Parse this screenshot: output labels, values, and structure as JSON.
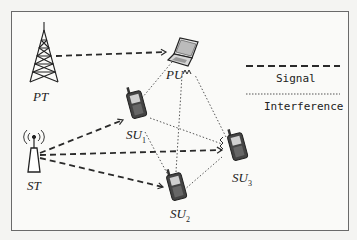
{
  "diagram": {
    "nodes": {
      "pt": {
        "label": "PT",
        "name": "Primary Transmitter",
        "icon": "cell-tower"
      },
      "pu": {
        "label": "PU",
        "name": "Primary User",
        "icon": "laptop"
      },
      "st": {
        "label": "ST",
        "name": "Secondary Transmitter",
        "icon": "antenna"
      },
      "su1": {
        "label": "SU",
        "sub": "1",
        "icon": "mobile-phone"
      },
      "su2": {
        "label": "SU",
        "sub": "2",
        "icon": "mobile-phone"
      },
      "su3": {
        "label": "SU",
        "sub": "3",
        "icon": "mobile-phone"
      }
    },
    "edges": [
      {
        "from": "PT",
        "to": "PU",
        "type": "signal"
      },
      {
        "from": "ST",
        "to": "SU1",
        "type": "signal"
      },
      {
        "from": "ST",
        "to": "SU2",
        "type": "signal"
      },
      {
        "from": "ST",
        "to": "SU3",
        "type": "signal"
      },
      {
        "from": "SU1",
        "to": "PU",
        "type": "interference"
      },
      {
        "from": "SU2",
        "to": "PU",
        "type": "interference"
      },
      {
        "from": "SU3",
        "to": "PU",
        "type": "interference"
      },
      {
        "from": "SU1",
        "to": "SU3",
        "type": "interference"
      },
      {
        "from": "SU1",
        "to": "SU2",
        "type": "interference"
      },
      {
        "from": "SU2",
        "to": "SU3",
        "type": "interference"
      }
    ],
    "legend": {
      "signal": "Signal",
      "interference": "Interference"
    },
    "colors": {
      "line": "#2a2a2a",
      "frame": "#6a6a6a",
      "background": "#fafaf8"
    }
  }
}
